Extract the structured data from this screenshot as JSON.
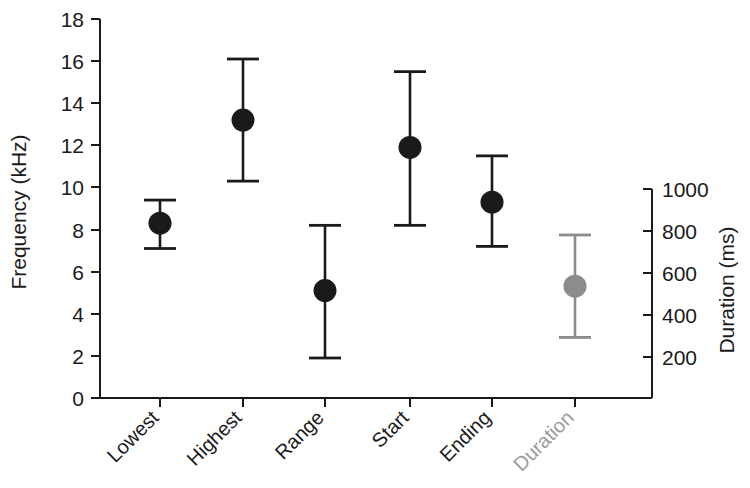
{
  "chart_data": {
    "type": "scatter",
    "title": "",
    "subtitle": "",
    "xlabel": "",
    "categories": [
      "Lowest",
      "Highest",
      "Range",
      "Start",
      "Ending",
      "Duration"
    ],
    "grid": false,
    "legend": "none",
    "annotations": [],
    "axes": {
      "left": {
        "label": "Frequency (kHz)",
        "unit": "kHz",
        "ylim": [
          0,
          18
        ],
        "ticks": [
          0,
          2,
          4,
          6,
          8,
          10,
          12,
          14,
          16,
          18
        ],
        "tick_labels": [
          "0",
          "2",
          "4",
          "6",
          "8",
          "10",
          "12",
          "14",
          "16",
          "18"
        ]
      },
      "right": {
        "label": "Duration (ms)",
        "unit": "ms",
        "ylim": [
          0,
          1000
        ],
        "ticks": [
          200,
          400,
          600,
          800,
          1000
        ],
        "tick_labels": [
          "200",
          "400",
          "600",
          "800",
          "1000"
        ]
      }
    },
    "series": [
      {
        "name": "Frequency measures",
        "axis": "left",
        "marker": "filled-circle",
        "color": "#1a1a1a",
        "points": [
          {
            "category": "Lowest",
            "mean": 8.3,
            "upper": 9.4,
            "lower": 7.1
          },
          {
            "category": "Highest",
            "mean": 13.2,
            "upper": 16.1,
            "lower": 10.3
          },
          {
            "category": "Range",
            "mean": 5.1,
            "upper": 8.2,
            "lower": 1.9
          },
          {
            "category": "Start",
            "mean": 11.9,
            "upper": 15.5,
            "lower": 8.2
          },
          {
            "category": "Ending",
            "mean": 9.3,
            "upper": 11.5,
            "lower": 7.2
          }
        ]
      },
      {
        "name": "Duration",
        "axis": "right",
        "marker": "filled-circle",
        "color": "#8c8c8c",
        "points": [
          {
            "category": "Duration",
            "mean": 535,
            "upper": 780,
            "lower": 290
          }
        ]
      }
    ]
  },
  "labels": {
    "left_axis_title": "Frequency (kHz)",
    "right_axis_title": "Duration (ms)",
    "left_ticks": [
      "18",
      "16",
      "14",
      "12",
      "10",
      "8",
      "6",
      "4",
      "2",
      "0"
    ],
    "right_ticks": [
      "1000",
      "800",
      "600",
      "400",
      "200"
    ],
    "categories": [
      "Lowest",
      "Highest",
      "Range",
      "Start",
      "Ending",
      "Duration"
    ]
  }
}
